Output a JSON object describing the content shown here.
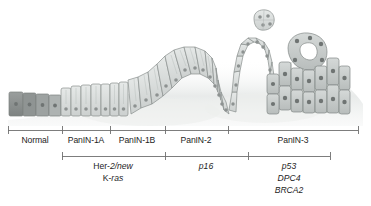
{
  "figure": {
    "name": "panin-progression-model"
  },
  "stage_axis": {
    "name": "stage-axis",
    "start_x": 8,
    "end_x": 358,
    "y": 6,
    "ticks": [
      8,
      62,
      110,
      165,
      228,
      358
    ],
    "stages": [
      {
        "label": "Normal",
        "from": 8,
        "to": 62,
        "center": 35
      },
      {
        "label": "PanIN-1A",
        "from": 62,
        "to": 110,
        "center": 86
      },
      {
        "label": "PanIN-1B",
        "from": 110,
        "to": 165,
        "center": 137
      },
      {
        "label": "PanIN-2",
        "from": 165,
        "to": 228,
        "center": 196
      },
      {
        "label": "PanIN-3",
        "from": 228,
        "to": 358,
        "center": 293
      }
    ]
  },
  "gene_axis": {
    "name": "gene-axis",
    "start_x": 62,
    "end_x": 330,
    "y": 32,
    "ticks": [
      62,
      165,
      248,
      330
    ],
    "groups": [
      {
        "center": 113,
        "from": 62,
        "to": 165,
        "genes": [
          {
            "prefix": "Her-",
            "italic": "2/new"
          },
          {
            "prefix": "K-",
            "italic": "ras"
          }
        ]
      },
      {
        "center": 206,
        "from": 165,
        "to": 248,
        "genes": [
          {
            "prefix": "",
            "italic": "p16"
          }
        ]
      },
      {
        "center": 289,
        "from": 248,
        "to": 330,
        "genes": [
          {
            "prefix": "",
            "italic": "p53"
          },
          {
            "prefix": "",
            "italic": "DPC4"
          },
          {
            "prefix": "",
            "italic": "BRCA2"
          }
        ]
      }
    ]
  },
  "colors": {
    "axis_line": "#6f6f6f",
    "text": "#1d1d1d",
    "cell_fill_normal": "#8e9191",
    "cell_fill_light": "#d9dcdb",
    "cell_fill_mid": "#c7cbca",
    "cell_fill_dark": "#adb2b1",
    "cell_stroke": "#8a8f8e",
    "nucleus": "#8d9291",
    "stroma": "#eceeed"
  },
  "epithelium": {
    "name": "epithelial-cell-layer",
    "regions": [
      {
        "stage": "Normal",
        "cell_height": "low-cuboidal",
        "tone": "dark-gray"
      },
      {
        "stage": "PanIN-1A",
        "cell_height": "tall-columnar",
        "tone": "light-gray"
      },
      {
        "stage": "PanIN-1B",
        "cell_height": "papillary",
        "tone": "light-gray"
      },
      {
        "stage": "PanIN-2",
        "cell_height": "papillary",
        "tone": "light-gray"
      },
      {
        "stage": "PanIN-3",
        "cell_height": "cribriform",
        "tone": "mid-gray"
      }
    ],
    "detached_cluster": {
      "present": true,
      "cx": 263,
      "cy": 24,
      "cell_count": 4
    }
  }
}
